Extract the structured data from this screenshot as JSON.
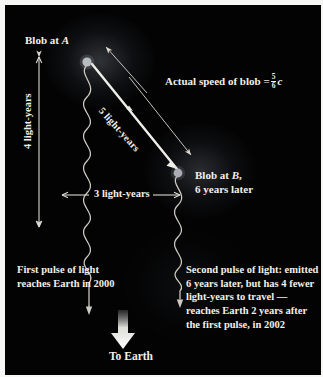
{
  "figure": {
    "kind": "astronomy-diagram",
    "background_color": "#030303",
    "ink_color": "#f2f0ea",
    "paper_color": "#f7f7f5"
  },
  "labels": {
    "blob_a": "Blob at",
    "blob_a_point": "A",
    "blob_b_line1_prefix": "Blob at",
    "blob_b_point": "B",
    "blob_b_line1_suffix": ",",
    "blob_b_line2": "6 years later",
    "speed_prefix": "Actual speed of blob =",
    "speed_numerator": "5",
    "speed_denominator": "6",
    "speed_unit": "c",
    "vertical_distance": "4 light-years",
    "horizontal_distance": "3 light-years",
    "diagonal_distance": "5 light-years",
    "first_pulse": "First pulse of light reaches Earth in 2000",
    "second_pulse": "Second pulse of light: emitted 6 years later, but has 4 fewer light-years to travel — reaches Earth 2 years after the first pulse, in 2002",
    "to_earth": "To Earth"
  },
  "markers": {
    "blob_a_position": {
      "x": 82,
      "y": 55
    },
    "blob_b_position": {
      "x": 173,
      "y": 167
    },
    "blob_color": "#b9bcc4"
  },
  "annotations": {
    "pointer_to_blob_a": "thin arrow pointing up-left to Blob at A",
    "pointer_to_blob_b": "thin arrow pointing down-right to Blob at B",
    "motion_arrow": "thick white arrow from Blob at A to Blob at B labelled 5 light-years",
    "vertical_measure": "double-headed vertical arrow spanning 4 light-years",
    "horizontal_measure": "double-headed horizontal arrow spanning 3 light-years",
    "light_pulse_1": "wavy line from Blob at A travelling down to Earth",
    "light_pulse_2": "wavy line from Blob at B travelling down to Earth",
    "earth_arrow": "large white arrow pointing down to Earth"
  }
}
